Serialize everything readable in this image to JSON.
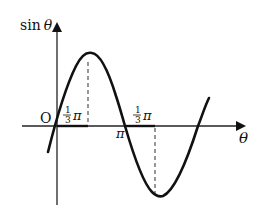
{
  "figure": {
    "type": "sine-wave-phase-diagram",
    "curve": "sin(theta - theta0)",
    "axes": {
      "y_label_func": "sin",
      "y_label_var": "θ",
      "x_label": "θ",
      "origin_label": "O"
    },
    "annotations": {
      "first_offset": {
        "num": "1",
        "den": "3",
        "sym": "π"
      },
      "pi_label": "π",
      "second_offset": {
        "num": "1",
        "den": "3",
        "sym": "π"
      }
    },
    "colors": {
      "stroke": "#111111",
      "axis": "#222222",
      "dash": "#444444",
      "background": "#ffffff"
    }
  }
}
